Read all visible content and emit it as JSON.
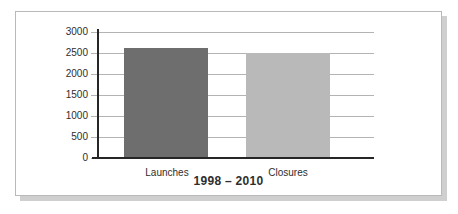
{
  "chart_data": {
    "type": "bar",
    "categories": [
      "Launches",
      "Closures"
    ],
    "values": [
      2620,
      2500
    ],
    "title": "",
    "xlabel": "1998 – 2010",
    "ylabel": "",
    "ylim": [
      0,
      3000
    ],
    "yticks": [
      0,
      500,
      1000,
      1500,
      2000,
      2500,
      3000
    ],
    "grid": true,
    "legend": "none",
    "bar_colors": [
      "#6e6e6e",
      "#b9b9b9"
    ]
  },
  "colors": {
    "background": "#ffffff",
    "card_background": "#ffffff",
    "card_border": "#b9b9b9",
    "card_shadow": "#cfcfcf",
    "gridline": "#b3b3b3",
    "axis": "#262626",
    "text": "#2e2e2e",
    "bar_launches": "#6e6e6e",
    "bar_closures": "#b9b9b9"
  }
}
